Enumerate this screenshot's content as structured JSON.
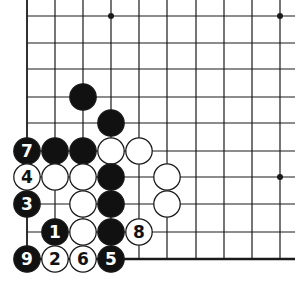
{
  "diagram": {
    "type": "go-board-diagram",
    "colors": {
      "background": "#ffffff",
      "line": "#1a1a1a",
      "black_stone": "#111111",
      "white_stone": "#ffffff",
      "black_label": "#ffffff",
      "white_label": "#111111"
    },
    "grid": {
      "columns_x": [
        27,
        55,
        83,
        111,
        139,
        167,
        196,
        224,
        252,
        280
      ],
      "rows_y": [
        16,
        43,
        69,
        97,
        123,
        151,
        177,
        204,
        232,
        259
      ],
      "line_right_end": 295,
      "line_top_start": 0,
      "bottom_edge_row": 9
    },
    "star_points": [
      {
        "col": 3,
        "row": 0
      },
      {
        "col": 9,
        "row": 0
      },
      {
        "col": 9,
        "row": 6
      }
    ],
    "stones": [
      {
        "col": 2,
        "row": 3,
        "color": "black",
        "label": ""
      },
      {
        "col": 3,
        "row": 4,
        "color": "black",
        "label": ""
      },
      {
        "col": 0,
        "row": 5,
        "color": "black",
        "label": "7"
      },
      {
        "col": 1,
        "row": 5,
        "color": "black",
        "label": ""
      },
      {
        "col": 2,
        "row": 5,
        "color": "black",
        "label": ""
      },
      {
        "col": 3,
        "row": 5,
        "color": "white",
        "label": ""
      },
      {
        "col": 4,
        "row": 5,
        "color": "white",
        "label": ""
      },
      {
        "col": 0,
        "row": 6,
        "color": "white",
        "label": "4"
      },
      {
        "col": 1,
        "row": 6,
        "color": "white",
        "label": ""
      },
      {
        "col": 2,
        "row": 6,
        "color": "white",
        "label": ""
      },
      {
        "col": 3,
        "row": 6,
        "color": "black",
        "label": ""
      },
      {
        "col": 5,
        "row": 6,
        "color": "white",
        "label": ""
      },
      {
        "col": 0,
        "row": 7,
        "color": "black",
        "label": "3"
      },
      {
        "col": 2,
        "row": 7,
        "color": "white",
        "label": ""
      },
      {
        "col": 3,
        "row": 7,
        "color": "black",
        "label": ""
      },
      {
        "col": 5,
        "row": 7,
        "color": "white",
        "label": ""
      },
      {
        "col": 1,
        "row": 8,
        "color": "black",
        "label": "1"
      },
      {
        "col": 2,
        "row": 8,
        "color": "white",
        "label": ""
      },
      {
        "col": 3,
        "row": 8,
        "color": "black",
        "label": ""
      },
      {
        "col": 4,
        "row": 8,
        "color": "white",
        "label": "8"
      },
      {
        "col": 0,
        "row": 9,
        "color": "black",
        "label": "9"
      },
      {
        "col": 1,
        "row": 9,
        "color": "white",
        "label": "2"
      },
      {
        "col": 2,
        "row": 9,
        "color": "white",
        "label": "6"
      },
      {
        "col": 3,
        "row": 9,
        "color": "black",
        "label": "5"
      }
    ]
  }
}
